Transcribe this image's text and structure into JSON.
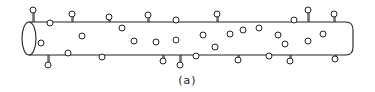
{
  "figure": {
    "caption": "(a)",
    "colors": {
      "stroke": "#222222",
      "background": "#ffffff"
    },
    "tube": {
      "x_left": 22,
      "x_right": 353,
      "y_top": 22,
      "y_bottom": 55,
      "end_cap": "ellipse-left, rounded-right"
    },
    "surface_particles_top": [
      {
        "x": 33,
        "y": 10,
        "type": "lollipop-out"
      },
      {
        "x": 50,
        "y": 23,
        "type": "knob-in"
      },
      {
        "x": 72,
        "y": 14,
        "type": "lollipop-out"
      },
      {
        "x": 109,
        "y": 17,
        "type": "lollipop-out"
      },
      {
        "x": 148,
        "y": 15,
        "type": "lollipop-out"
      },
      {
        "x": 176,
        "y": 20,
        "type": "bump"
      },
      {
        "x": 217,
        "y": 14,
        "type": "lollipop-out"
      },
      {
        "x": 294,
        "y": 20,
        "type": "knob"
      },
      {
        "x": 308,
        "y": 10,
        "type": "lollipop-out"
      },
      {
        "x": 334,
        "y": 14,
        "type": "lollipop-out"
      }
    ],
    "surface_particles_bottom": [
      {
        "x": 48,
        "y": 65,
        "type": "lollipop-out"
      },
      {
        "x": 68,
        "y": 53,
        "type": "bump"
      },
      {
        "x": 102,
        "y": 57,
        "type": "bump"
      },
      {
        "x": 163,
        "y": 61,
        "type": "lollipop-out"
      },
      {
        "x": 180,
        "y": 65,
        "type": "lollipop-out"
      },
      {
        "x": 196,
        "y": 56,
        "type": "bump"
      },
      {
        "x": 238,
        "y": 60,
        "type": "lollipop-out"
      },
      {
        "x": 269,
        "y": 56,
        "type": "bump"
      },
      {
        "x": 290,
        "y": 61,
        "type": "lollipop-out"
      },
      {
        "x": 335,
        "y": 59,
        "type": "lollipop-out"
      }
    ],
    "interior_particles": [
      {
        "x": 41,
        "y": 43
      },
      {
        "x": 82,
        "y": 36
      },
      {
        "x": 122,
        "y": 28
      },
      {
        "x": 134,
        "y": 41
      },
      {
        "x": 156,
        "y": 42
      },
      {
        "x": 176,
        "y": 40
      },
      {
        "x": 203,
        "y": 35
      },
      {
        "x": 215,
        "y": 47
      },
      {
        "x": 230,
        "y": 34
      },
      {
        "x": 243,
        "y": 30
      },
      {
        "x": 259,
        "y": 28
      },
      {
        "x": 278,
        "y": 35
      },
      {
        "x": 285,
        "y": 44
      },
      {
        "x": 308,
        "y": 41
      },
      {
        "x": 323,
        "y": 34
      }
    ]
  }
}
